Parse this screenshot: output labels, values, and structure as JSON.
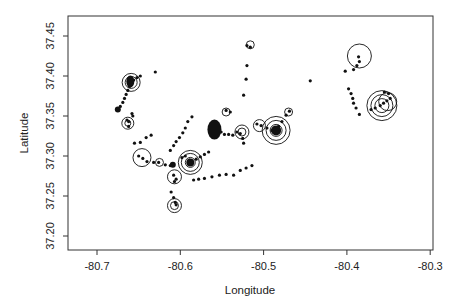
{
  "chart_data": {
    "type": "scatter",
    "title": "",
    "xlabel": "Longitude",
    "ylabel": "Latitude",
    "xlim": [
      -80.735,
      -80.295
    ],
    "ylim": [
      37.2175,
      37.4725
    ],
    "xticks": [
      -80.7,
      -80.6,
      -80.5,
      -80.4,
      -80.3
    ],
    "xtick_labels": [
      "-80.7",
      "-80.6",
      "-80.5",
      "-80.4",
      "-80.3"
    ],
    "yticks": [
      37.2,
      37.25,
      37.3,
      37.35,
      37.4,
      37.45
    ],
    "ytick_labels": [
      "37.20",
      "37.25",
      "37.30",
      "37.35",
      "37.40",
      "37.45"
    ],
    "grid": false,
    "legend": null,
    "series": [
      {
        "name": "points",
        "marker": "filled-dot",
        "points": [
          [
            -80.675,
            37.358
          ],
          [
            -80.672,
            37.362
          ],
          [
            -80.669,
            37.367
          ],
          [
            -80.667,
            37.372
          ],
          [
            -80.665,
            37.377
          ],
          [
            -80.663,
            37.382
          ],
          [
            -80.661,
            37.387
          ],
          [
            -80.659,
            37.391
          ],
          [
            -80.656,
            37.395
          ],
          [
            -80.652,
            37.398
          ],
          [
            -80.648,
            37.4
          ],
          [
            -80.664,
            37.345
          ],
          [
            -80.662,
            37.343
          ],
          [
            -80.662,
            37.337
          ],
          [
            -80.658,
            37.353
          ],
          [
            -80.657,
            37.35
          ],
          [
            -80.63,
            37.405
          ],
          [
            -80.65,
            37.3
          ],
          [
            -80.645,
            37.297
          ],
          [
            -80.64,
            37.293
          ],
          [
            -80.632,
            37.292
          ],
          [
            -80.626,
            37.292
          ],
          [
            -80.618,
            37.289
          ],
          [
            -80.612,
            37.288
          ],
          [
            -80.655,
            37.316
          ],
          [
            -80.648,
            37.317
          ],
          [
            -80.641,
            37.323
          ],
          [
            -80.635,
            37.326
          ],
          [
            -80.608,
            37.276
          ],
          [
            -80.605,
            37.271
          ],
          [
            -80.607,
            37.268
          ],
          [
            -80.611,
            37.255
          ],
          [
            -80.608,
            37.248
          ],
          [
            -80.606,
            37.242
          ],
          [
            -80.605,
            37.239
          ],
          [
            -80.612,
            37.307
          ],
          [
            -80.608,
            37.313
          ],
          [
            -80.605,
            37.318
          ],
          [
            -80.601,
            37.323
          ],
          [
            -80.597,
            37.329
          ],
          [
            -80.594,
            37.335
          ],
          [
            -80.591,
            37.343
          ],
          [
            -80.586,
            37.349
          ],
          [
            -80.598,
            37.298
          ],
          [
            -80.594,
            37.3
          ],
          [
            -80.589,
            37.295
          ],
          [
            -80.586,
            37.292
          ],
          [
            -80.581,
            37.296
          ],
          [
            -80.576,
            37.299
          ],
          [
            -80.571,
            37.302
          ],
          [
            -80.566,
            37.305
          ],
          [
            -80.584,
            37.27
          ],
          [
            -80.578,
            37.271
          ],
          [
            -80.571,
            37.272
          ],
          [
            -80.562,
            37.274
          ],
          [
            -80.553,
            37.276
          ],
          [
            -80.545,
            37.277
          ],
          [
            -80.536,
            37.276
          ],
          [
            -80.528,
            37.282
          ],
          [
            -80.521,
            37.285
          ],
          [
            -80.514,
            37.288
          ],
          [
            -80.56,
            37.335
          ],
          [
            -80.557,
            37.338
          ],
          [
            -80.554,
            37.334
          ],
          [
            -80.551,
            37.33
          ],
          [
            -80.547,
            37.327
          ],
          [
            -80.542,
            37.327
          ],
          [
            -80.537,
            37.326
          ],
          [
            -80.532,
            37.33
          ],
          [
            -80.528,
            37.328
          ],
          [
            -80.525,
            37.322
          ],
          [
            -80.524,
            37.316
          ],
          [
            -80.545,
            37.357
          ],
          [
            -80.54,
            37.355
          ],
          [
            -80.524,
            37.376
          ],
          [
            -80.521,
            37.396
          ],
          [
            -80.52,
            37.413
          ],
          [
            -80.52,
            37.438
          ],
          [
            -80.516,
            37.436
          ],
          [
            -80.508,
            37.34
          ],
          [
            -80.503,
            37.338
          ],
          [
            -80.496,
            37.335
          ],
          [
            -80.49,
            37.332
          ],
          [
            -80.486,
            37.334
          ],
          [
            -80.482,
            37.337
          ],
          [
            -80.478,
            37.343
          ],
          [
            -80.473,
            37.351
          ],
          [
            -80.469,
            37.356
          ],
          [
            -80.444,
            37.394
          ],
          [
            -80.398,
            37.384
          ],
          [
            -80.395,
            37.378
          ],
          [
            -80.393,
            37.372
          ],
          [
            -80.392,
            37.366
          ],
          [
            -80.389,
            37.36
          ],
          [
            -80.385,
            37.352
          ],
          [
            -80.386,
            37.424
          ],
          [
            -80.385,
            37.418
          ],
          [
            -80.388,
            37.413
          ],
          [
            -80.392,
            37.408
          ],
          [
            -80.402,
            37.406
          ],
          [
            -80.371,
            37.358
          ],
          [
            -80.366,
            37.36
          ],
          [
            -80.36,
            37.363
          ],
          [
            -80.356,
            37.366
          ],
          [
            -80.352,
            37.369
          ],
          [
            -80.348,
            37.372
          ],
          [
            -80.35,
            37.378
          ],
          [
            -80.355,
            37.38
          ]
        ]
      },
      {
        "name": "circles",
        "marker": "open-circle",
        "points": [
          {
            "lon": -80.659,
            "lat": 37.392,
            "r": 9
          },
          {
            "lon": -80.659,
            "lat": 37.392,
            "r": 6
          },
          {
            "lon": -80.663,
            "lat": 37.341,
            "r": 6
          },
          {
            "lon": -80.663,
            "lat": 37.341,
            "r": 3
          },
          {
            "lon": -80.646,
            "lat": 37.298,
            "r": 9
          },
          {
            "lon": -80.607,
            "lat": 37.274,
            "r": 7
          },
          {
            "lon": -80.607,
            "lat": 37.238,
            "r": 7
          },
          {
            "lon": -80.607,
            "lat": 37.238,
            "r": 4
          },
          {
            "lon": -80.588,
            "lat": 37.292,
            "r": 12
          },
          {
            "lon": -80.588,
            "lat": 37.292,
            "r": 9
          },
          {
            "lon": -80.588,
            "lat": 37.292,
            "r": 5
          },
          {
            "lon": -80.625,
            "lat": 37.292,
            "r": 4
          },
          {
            "lon": -80.545,
            "lat": 37.355,
            "r": 4
          },
          {
            "lon": -80.526,
            "lat": 37.33,
            "r": 7
          },
          {
            "lon": -80.526,
            "lat": 37.33,
            "r": 4
          },
          {
            "lon": -80.505,
            "lat": 37.338,
            "r": 6
          },
          {
            "lon": -80.485,
            "lat": 37.332,
            "r": 14
          },
          {
            "lon": -80.485,
            "lat": 37.332,
            "r": 10
          },
          {
            "lon": -80.485,
            "lat": 37.332,
            "r": 6
          },
          {
            "lon": -80.47,
            "lat": 37.355,
            "r": 4
          },
          {
            "lon": -80.516,
            "lat": 37.439,
            "r": 4
          },
          {
            "lon": -80.385,
            "lat": 37.425,
            "r": 12
          },
          {
            "lon": -80.358,
            "lat": 37.363,
            "r": 15
          },
          {
            "lon": -80.358,
            "lat": 37.363,
            "r": 11
          },
          {
            "lon": -80.358,
            "lat": 37.363,
            "r": 7
          },
          {
            "lon": -80.351,
            "lat": 37.368,
            "r": 9
          }
        ]
      },
      {
        "name": "blobs",
        "marker": "filled-ellipse",
        "points": [
          {
            "lon": -80.559,
            "lat": 37.333,
            "rx": 7,
            "ry": 10
          },
          {
            "lon": -80.66,
            "lat": 37.393,
            "rx": 4,
            "ry": 6
          },
          {
            "lon": -80.588,
            "lat": 37.292,
            "rx": 4,
            "ry": 4
          },
          {
            "lon": -80.485,
            "lat": 37.332,
            "rx": 5,
            "ry": 5
          },
          {
            "lon": -80.609,
            "lat": 37.289,
            "rx": 3,
            "ry": 3
          },
          {
            "lon": -80.675,
            "lat": 37.358,
            "rx": 3,
            "ry": 3
          }
        ]
      }
    ]
  }
}
